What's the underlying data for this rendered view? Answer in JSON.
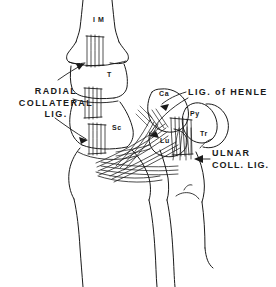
{
  "figure": {
    "background_color": "#ffffff",
    "ink_color": "#1a1a1a",
    "view": "dorsal view of the carpus showing collateral ligaments"
  },
  "labels": {
    "radial_collateral": {
      "line1": "RADIAL",
      "line2": "COLLATERAL",
      "line3": "LIG."
    },
    "henle": "LIG. of HENLE",
    "ulnar": {
      "line1": "ULNAR",
      "line2": "COLL. LIG."
    }
  },
  "bones": [
    {
      "key": "im",
      "label": "I M",
      "name": "first-metacarpal"
    },
    {
      "key": "t",
      "label": "T",
      "name": "trapezium"
    },
    {
      "key": "sc",
      "label": "Sc",
      "name": "scaphoid"
    },
    {
      "key": "ca",
      "label": "Ca",
      "name": "capitate"
    },
    {
      "key": "py",
      "label": "Py",
      "name": "pisiform"
    },
    {
      "key": "lu",
      "label": "Lu",
      "name": "lunate"
    },
    {
      "key": "tr",
      "label": "Tr",
      "name": "triquetrum"
    }
  ]
}
